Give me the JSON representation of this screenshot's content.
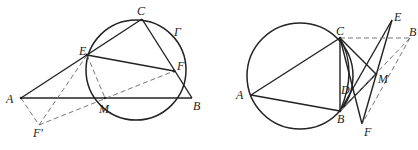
{
  "figures": [
    {
      "id": "left",
      "circle": {
        "name": "Γ",
        "cx": 136,
        "cy": 70,
        "r": 50
      },
      "points": {
        "A": [
          21,
          98
        ],
        "B": [
          192,
          98
        ],
        "C": [
          142,
          19
        ],
        "E": [
          87,
          55
        ],
        "F": [
          174,
          71
        ],
        "M": [
          105,
          98
        ],
        "F'": [
          39,
          125
        ]
      },
      "labels": {
        "A": "A",
        "B": "B",
        "C": "C",
        "E": "E",
        "F": "F",
        "M": "M",
        "Fp": "F'",
        "Gamma": "Γ"
      },
      "solid_segments": [
        [
          "A",
          "C"
        ],
        [
          "C",
          "B"
        ],
        [
          "A",
          "B"
        ],
        [
          "E",
          "F"
        ]
      ],
      "dashed_segments": [
        [
          "A",
          "F'"
        ],
        [
          "F'",
          "E"
        ],
        [
          "F'",
          "F"
        ],
        [
          "E",
          "M"
        ]
      ]
    },
    {
      "id": "right",
      "circle": {
        "cx": 300,
        "cy": 76,
        "r": 53
      },
      "points": {
        "A": [
          251,
          95
        ],
        "B": [
          340,
          111
        ],
        "C": [
          340,
          38
        ],
        "D": [
          352,
          89
        ],
        "E": [
          392,
          20
        ],
        "B'": [
          410,
          38
        ],
        "M": [
          376,
          74
        ],
        "F": [
          362,
          124
        ]
      },
      "labels": {
        "A": "A",
        "B": "B",
        "C": "C",
        "D": "D",
        "E": "E",
        "Bp": "B",
        "M": "M",
        "F": "F"
      },
      "solid_segments": [
        [
          "A",
          "C"
        ],
        [
          "A",
          "B"
        ],
        [
          "C",
          "B"
        ],
        [
          "C",
          "M"
        ],
        [
          "C",
          "F"
        ],
        [
          "B",
          "E"
        ],
        [
          "B",
          "M"
        ],
        [
          "E",
          "F"
        ]
      ],
      "dashed_segments": [
        [
          "C",
          "B'"
        ],
        [
          "B'",
          "F"
        ],
        [
          "B'",
          "B"
        ]
      ]
    }
  ]
}
